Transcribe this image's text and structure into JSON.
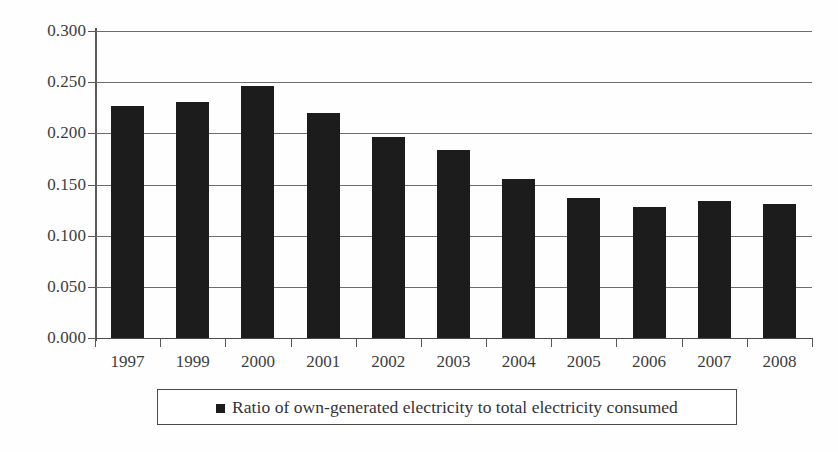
{
  "chart_data": {
    "type": "bar",
    "title": "",
    "subtitle": "",
    "xlabel": "",
    "ylabel": "",
    "categories": [
      "1997",
      "1999",
      "2000",
      "2001",
      "2002",
      "2003",
      "2004",
      "2005",
      "2006",
      "2007",
      "2008"
    ],
    "values": [
      0.227,
      0.231,
      0.246,
      0.22,
      0.196,
      0.184,
      0.155,
      0.137,
      0.128,
      0.134,
      0.131
    ],
    "series": [
      {
        "name": "Ratio of own-generated electricity to total electricity consumed",
        "values": [
          0.227,
          0.231,
          0.246,
          0.22,
          0.196,
          0.184,
          0.155,
          0.137,
          0.128,
          0.134,
          0.131
        ]
      }
    ],
    "ylim": [
      0.0,
      0.3
    ],
    "ytick_values": [
      0.0,
      0.05,
      0.1,
      0.15,
      0.2,
      0.25,
      0.3
    ],
    "ytick_labels": [
      "0.000",
      "0.050",
      "0.100",
      "0.150",
      "0.200",
      "0.250",
      "0.300"
    ],
    "grid": true,
    "grid_axis": "y",
    "legend_position": "bottom",
    "bar_color": "#1c1c1c",
    "axis_color": "#4a4a4a",
    "gridline_color": "#6e6e6e",
    "background_color": "#ffffff"
  },
  "legend": {
    "marker": "filled-square",
    "label": "Ratio of own-generated electricity to total electricity consumed"
  }
}
